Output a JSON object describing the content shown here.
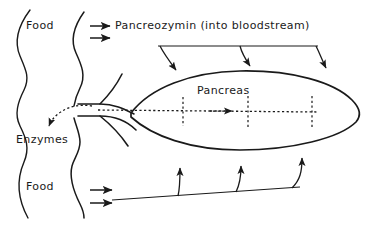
{
  "diagram": {
    "background_color": "#ffffff",
    "stroke_color": "#1a1a1a",
    "labels": {
      "food_top": "Food",
      "enzymes": "Enzymes",
      "food_bottom": "Food",
      "pancreozymin": "Pancreozymin (into bloodstream)",
      "pancreas": "Pancreas"
    },
    "structures": [
      {
        "name": "gut-outer-wall",
        "type": "wavy-line",
        "description": "Outer wavy wall of the gut on the far left"
      },
      {
        "name": "gut-inner-wall",
        "type": "wavy-line",
        "description": "Inner wavy wall of the gut, broken where the pancreatic duct enters"
      },
      {
        "name": "pancreas-body",
        "type": "ellipse-outline",
        "description": "Large lens-shaped outline of the pancreas"
      },
      {
        "name": "pancreatic-duct",
        "type": "funnel",
        "description": "Cone-shaped duct narrowing from the pancreas to the gut wall"
      },
      {
        "name": "duct-dotted-axis",
        "type": "dotted-line",
        "description": "Dotted central duct line running through the pancreas"
      },
      {
        "name": "duct-branches",
        "type": "dotted-line",
        "count": 3,
        "description": "Three vertical dotted branch ducts inside the pancreas"
      }
    ],
    "arrows": [
      {
        "name": "food-top-arrows",
        "count": 2,
        "direction": "right",
        "description": "Food entering, two short arrows pointing right from the gut"
      },
      {
        "name": "pancreozymin-to-pancreas-arrows",
        "count": 3,
        "direction": "down",
        "description": "Pancreozymin arriving at the pancreas from the bloodstream"
      },
      {
        "name": "enzymes-output-arrow",
        "count": 1,
        "direction": "down-left",
        "style": "dotted",
        "description": "Dotted arrow carrying enzymes out of the duct into the gut"
      },
      {
        "name": "duct-flow-arrow",
        "count": 1,
        "direction": "right",
        "style": "dotted",
        "description": "Dotted arrowhead on the duct axis inside the pancreas"
      },
      {
        "name": "food-bottom-arrows",
        "count": 2,
        "direction": "right",
        "description": "Food entering the gut at the lower level"
      },
      {
        "name": "food-to-pancreas-arrows",
        "count": 3,
        "direction": "up",
        "description": "Three arrows rising from the food line up toward the pancreas"
      }
    ]
  }
}
